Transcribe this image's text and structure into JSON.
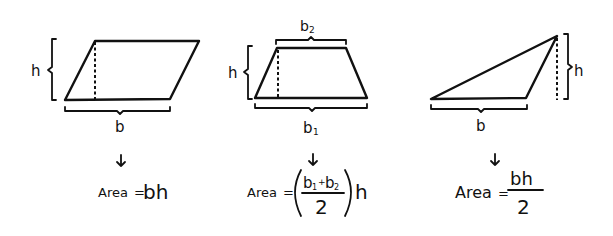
{
  "diagram": {
    "colors": {
      "ink": "#111111",
      "background": "#ffffff"
    },
    "panels": [
      {
        "shape": "parallelogram",
        "labels": {
          "height": "h",
          "base": "b"
        },
        "formula": {
          "prefix": "Area",
          "equals": "=",
          "expression": "bh"
        }
      },
      {
        "shape": "trapezoid",
        "labels": {
          "height": "h",
          "top_base": "b",
          "top_base_sub": "2",
          "bottom_base": "b",
          "bottom_base_sub": "1"
        },
        "formula": {
          "prefix": "Area",
          "equals": "=",
          "numerator_b1": "b",
          "numerator_b1_sub": "1",
          "plus": "+",
          "numerator_b2": "b",
          "numerator_b2_sub": "2",
          "denominator": "2",
          "open_paren": "(",
          "close_paren": ")",
          "multiplier": "h"
        }
      },
      {
        "shape": "triangle",
        "labels": {
          "height": "h",
          "base": "b"
        },
        "formula": {
          "prefix": "Area",
          "equals": "=",
          "numerator": "bh",
          "denominator": "2"
        }
      }
    ]
  }
}
